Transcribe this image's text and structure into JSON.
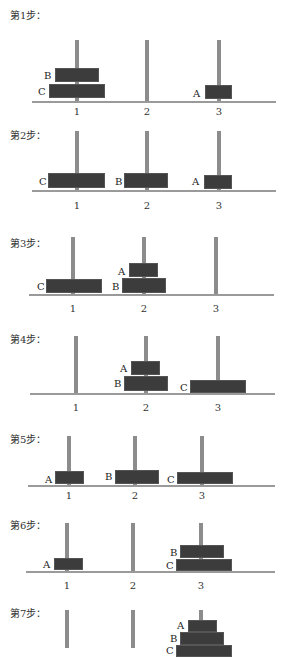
{
  "steps": [
    {
      "label": "第1步：",
      "label_y": 7,
      "pegs": [
        {
          "x": 77,
          "top": 40,
          "bottom": 101
        },
        {
          "x": 147,
          "top": 40,
          "bottom": 101
        },
        {
          "x": 219,
          "top": 40,
          "bottom": 101
        }
      ],
      "base": {
        "y": 101,
        "x1": 32,
        "x2": 276
      },
      "numbers": [
        "1",
        "2",
        "3"
      ],
      "numbers_y": 106,
      "disks": [
        {
          "name": "B",
          "x": 55,
          "y": 68,
          "w": 44,
          "h": 14,
          "lx": 44,
          "ly": 70
        },
        {
          "name": "C",
          "x": 49,
          "y": 84,
          "w": 56,
          "h": 14,
          "lx": 38,
          "ly": 86
        },
        {
          "name": "A",
          "x": 205,
          "y": 85,
          "w": 27,
          "h": 14,
          "lx": 193,
          "ly": 88
        }
      ]
    },
    {
      "label": "第2步：",
      "label_y": 127,
      "pegs": [
        {
          "x": 77,
          "top": 131,
          "bottom": 190
        },
        {
          "x": 147,
          "top": 131,
          "bottom": 190
        },
        {
          "x": 219,
          "top": 131,
          "bottom": 190
        }
      ],
      "base": {
        "y": 190,
        "x1": 32,
        "x2": 276
      },
      "numbers": [
        "1",
        "2",
        "3"
      ],
      "numbers_y": 200,
      "disks": [
        {
          "name": "C",
          "x": 48,
          "y": 173,
          "w": 57,
          "h": 15,
          "lx": 39,
          "ly": 176
        },
        {
          "name": "B",
          "x": 124,
          "y": 173,
          "w": 44,
          "h": 15,
          "lx": 115,
          "ly": 176
        },
        {
          "name": "A",
          "x": 204,
          "y": 175,
          "w": 28,
          "h": 14,
          "lx": 192,
          "ly": 176
        }
      ]
    },
    {
      "label": "第3步：",
      "label_y": 235,
      "pegs": [
        {
          "x": 73,
          "top": 237,
          "bottom": 294
        },
        {
          "x": 144,
          "top": 237,
          "bottom": 294
        },
        {
          "x": 216,
          "top": 237,
          "bottom": 294
        }
      ],
      "base": {
        "y": 294,
        "x1": 29,
        "x2": 274
      },
      "numbers": [
        "1",
        "2",
        "3"
      ],
      "numbers_y": 303,
      "disks": [
        {
          "name": "C",
          "x": 46,
          "y": 279,
          "w": 56,
          "h": 14,
          "lx": 37,
          "ly": 281
        },
        {
          "name": "A",
          "x": 129,
          "y": 263,
          "w": 29,
          "h": 14,
          "lx": 118,
          "ly": 266
        },
        {
          "name": "B",
          "x": 122,
          "y": 278,
          "w": 44,
          "h": 15,
          "lx": 112,
          "ly": 281
        }
      ]
    },
    {
      "label": "第4步：",
      "label_y": 331,
      "pegs": [
        {
          "x": 76,
          "top": 336,
          "bottom": 393
        },
        {
          "x": 146,
          "top": 336,
          "bottom": 393
        },
        {
          "x": 218,
          "top": 336,
          "bottom": 393
        }
      ],
      "base": {
        "y": 393,
        "x1": 30,
        "x2": 275
      },
      "numbers": [
        "1",
        "2",
        "3"
      ],
      "numbers_y": 402,
      "disks": [
        {
          "name": "A",
          "x": 131,
          "y": 361,
          "w": 29,
          "h": 14,
          "lx": 120,
          "ly": 363
        },
        {
          "name": "B",
          "x": 124,
          "y": 376,
          "w": 44,
          "h": 15,
          "lx": 114,
          "ly": 378
        },
        {
          "name": "C",
          "x": 190,
          "y": 380,
          "w": 56,
          "h": 13,
          "lx": 180,
          "ly": 382
        }
      ]
    },
    {
      "label": "第5步：",
      "label_y": 431,
      "pegs": [
        {
          "x": 69,
          "top": 436,
          "bottom": 485
        },
        {
          "x": 135,
          "top": 436,
          "bottom": 485
        },
        {
          "x": 202,
          "top": 436,
          "bottom": 485
        }
      ],
      "base": {
        "y": 485,
        "x1": 28,
        "x2": 275
      },
      "numbers": [
        "1",
        "2",
        "3"
      ],
      "numbers_y": 490,
      "disks": [
        {
          "name": "A",
          "x": 55,
          "y": 471,
          "w": 29,
          "h": 13,
          "lx": 45,
          "ly": 474
        },
        {
          "name": "B",
          "x": 115,
          "y": 470,
          "w": 44,
          "h": 14,
          "lx": 105,
          "ly": 471
        },
        {
          "name": "C",
          "x": 177,
          "y": 472,
          "w": 56,
          "h": 12,
          "lx": 167,
          "ly": 474
        }
      ]
    },
    {
      "label": "第6步：",
      "label_y": 517,
      "pegs": [
        {
          "x": 67,
          "top": 523,
          "bottom": 571
        },
        {
          "x": 133,
          "top": 523,
          "bottom": 571
        },
        {
          "x": 201,
          "top": 523,
          "bottom": 571
        }
      ],
      "base": {
        "y": 571,
        "x1": 26,
        "x2": 275
      },
      "numbers": [
        "1",
        "2",
        "3"
      ],
      "numbers_y": 580,
      "disks": [
        {
          "name": "A",
          "x": 54,
          "y": 558,
          "w": 29,
          "h": 12,
          "lx": 43,
          "ly": 559
        },
        {
          "name": "B",
          "x": 180,
          "y": 545,
          "w": 44,
          "h": 13,
          "lx": 170,
          "ly": 547
        },
        {
          "name": "C",
          "x": 176,
          "y": 559,
          "w": 56,
          "h": 12,
          "lx": 166,
          "ly": 560
        }
      ]
    },
    {
      "label": "第7步：",
      "label_y": 605,
      "pegs": [
        {
          "x": 67,
          "top": 610,
          "bottom": 648
        },
        {
          "x": 133,
          "top": 610,
          "bottom": 648
        },
        {
          "x": 201,
          "top": 610,
          "bottom": 648
        }
      ],
      "base": null,
      "numbers": [],
      "numbers_y": 0,
      "disks": [
        {
          "name": "A",
          "x": 188,
          "y": 620,
          "w": 29,
          "h": 12,
          "lx": 177,
          "ly": 620
        },
        {
          "name": "B",
          "x": 180,
          "y": 632,
          "w": 44,
          "h": 13,
          "lx": 170,
          "ly": 633
        },
        {
          "name": "C",
          "x": 176,
          "y": 645,
          "w": 56,
          "h": 12,
          "lx": 166,
          "ly": 645
        }
      ]
    }
  ],
  "colors": {
    "disk": "#3c3c3c",
    "peg": "#8c8c8c",
    "base": "#9a9a9a"
  }
}
